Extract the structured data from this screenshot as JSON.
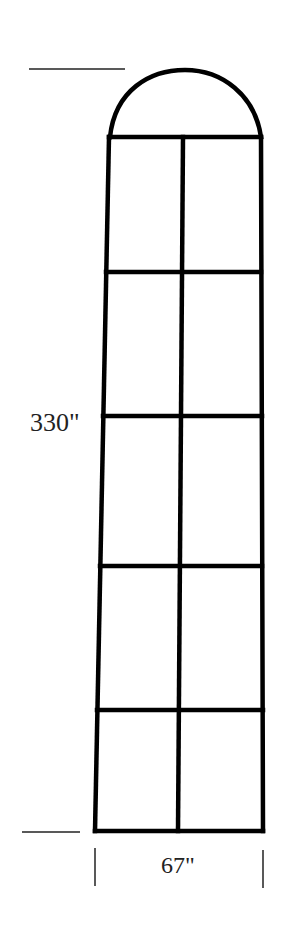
{
  "diagram": {
    "type": "arched window elevation",
    "height_label": "330\"",
    "width_label": "67\"",
    "panes": {
      "rows": 5,
      "columns": 2
    },
    "top": "semicircular arch transom",
    "line_color": "#000000",
    "background": "#ffffff"
  }
}
